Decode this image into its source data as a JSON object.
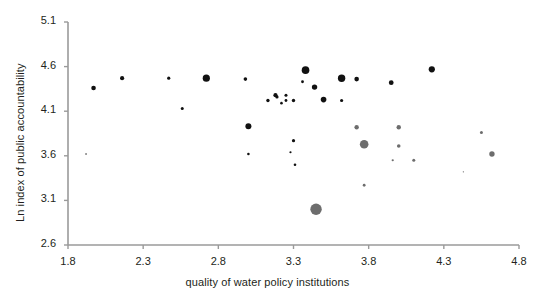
{
  "chart_data": {
    "type": "scatter",
    "title": "",
    "xlabel": "quality of water policy institutions",
    "ylabel": "Ln index of public accountability",
    "xlim": [
      1.8,
      4.8
    ],
    "ylim": [
      2.6,
      5.1
    ],
    "xticks": [
      "1.8",
      "2.3",
      "2.8",
      "3.3",
      "3.8",
      "4.3",
      "4.8"
    ],
    "yticks": [
      "2.6",
      "3.1",
      "3.6",
      "4.1",
      "4.6",
      "5.1"
    ],
    "grid": false,
    "legend": "none",
    "colors": {
      "group_black": "#111111",
      "group_gray": "#6d6d6d",
      "axis": "#8c8c8c",
      "text": "#231f20"
    },
    "note": "Bubble scatter: marker area encodes a third variable (bubble size). Two colour groups present.",
    "series": [
      {
        "name": "black",
        "color": "#111111",
        "points": [
          {
            "x": 1.97,
            "y": 4.36,
            "size": 4.6
          },
          {
            "x": 2.16,
            "y": 4.47,
            "size": 4.2
          },
          {
            "x": 2.47,
            "y": 4.47,
            "size": 3.2
          },
          {
            "x": 2.56,
            "y": 4.13,
            "size": 3.0
          },
          {
            "x": 2.72,
            "y": 4.47,
            "size": 7.2
          },
          {
            "x": 2.98,
            "y": 4.46,
            "size": 3.6
          },
          {
            "x": 3.0,
            "y": 3.93,
            "size": 6.0
          },
          {
            "x": 3.0,
            "y": 3.62,
            "size": 2.6
          },
          {
            "x": 3.13,
            "y": 4.22,
            "size": 3.4
          },
          {
            "x": 3.18,
            "y": 4.28,
            "size": 4.2
          },
          {
            "x": 3.19,
            "y": 4.26,
            "size": 3.2
          },
          {
            "x": 3.22,
            "y": 4.19,
            "size": 2.6
          },
          {
            "x": 3.25,
            "y": 4.28,
            "size": 3.0
          },
          {
            "x": 3.25,
            "y": 4.22,
            "size": 2.8
          },
          {
            "x": 3.28,
            "y": 3.64,
            "size": 2.2
          },
          {
            "x": 3.3,
            "y": 4.22,
            "size": 3.4
          },
          {
            "x": 3.3,
            "y": 3.77,
            "size": 3.2
          },
          {
            "x": 3.31,
            "y": 3.5,
            "size": 2.6
          },
          {
            "x": 3.38,
            "y": 4.56,
            "size": 7.6
          },
          {
            "x": 3.36,
            "y": 4.43,
            "size": 2.8
          },
          {
            "x": 3.44,
            "y": 4.37,
            "size": 5.4
          },
          {
            "x": 3.5,
            "y": 4.23,
            "size": 5.6
          },
          {
            "x": 3.62,
            "y": 4.47,
            "size": 7.4
          },
          {
            "x": 3.62,
            "y": 4.22,
            "size": 3.2
          },
          {
            "x": 3.72,
            "y": 4.46,
            "size": 4.6
          },
          {
            "x": 3.95,
            "y": 4.42,
            "size": 4.8
          },
          {
            "x": 4.22,
            "y": 4.57,
            "size": 6.2
          },
          {
            "x": 1.92,
            "y": 3.62,
            "size": 1.4
          }
        ]
      },
      {
        "name": "gray",
        "color": "#6d6d6d",
        "points": [
          {
            "x": 3.72,
            "y": 3.92,
            "size": 4.4
          },
          {
            "x": 3.77,
            "y": 3.73,
            "size": 8.6
          },
          {
            "x": 3.77,
            "y": 3.27,
            "size": 2.8
          },
          {
            "x": 3.45,
            "y": 3.0,
            "size": 11.4
          },
          {
            "x": 3.96,
            "y": 3.55,
            "size": 2.2
          },
          {
            "x": 4.0,
            "y": 3.92,
            "size": 4.4
          },
          {
            "x": 4.0,
            "y": 3.71,
            "size": 3.6
          },
          {
            "x": 4.1,
            "y": 3.55,
            "size": 3.0
          },
          {
            "x": 4.55,
            "y": 3.86,
            "size": 3.0
          },
          {
            "x": 4.62,
            "y": 3.62,
            "size": 5.4
          },
          {
            "x": 4.43,
            "y": 3.42,
            "size": 1.4
          }
        ]
      }
    ]
  },
  "axes": {
    "x_title": "quality of water policy institutions",
    "y_title": "Ln index of public accountability"
  }
}
